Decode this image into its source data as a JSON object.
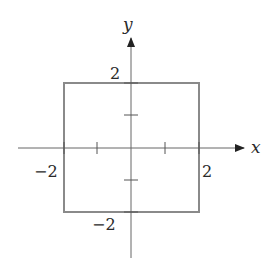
{
  "diagram": {
    "type": "coordinate-plane",
    "axes": {
      "x_label": "x",
      "y_label": "y"
    },
    "shape": {
      "kind": "square",
      "corners": [
        [
          -2,
          2
        ],
        [
          2,
          2
        ],
        [
          2,
          -2
        ],
        [
          -2,
          -2
        ]
      ],
      "stroke": "#888888"
    },
    "tick_labels": {
      "y_top": "2",
      "y_bottom": "−2",
      "x_left": "−2",
      "x_right": "2"
    },
    "ticks": [
      -2,
      -1,
      1,
      2
    ],
    "axis_color": "#555555"
  }
}
